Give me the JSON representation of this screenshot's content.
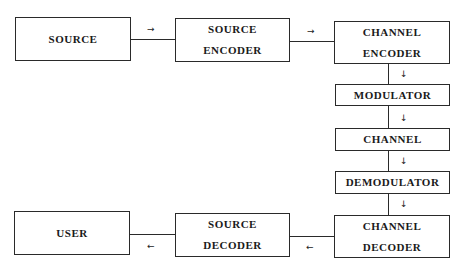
{
  "diagram": {
    "type": "block-diagram",
    "blocks": [
      {
        "id": "source",
        "lines": [
          "SOURCE"
        ]
      },
      {
        "id": "source_encoder",
        "lines": [
          "SOURCE",
          "ENCODER"
        ]
      },
      {
        "id": "channel_encoder",
        "lines": [
          "CHANNEL",
          "ENCODER"
        ]
      },
      {
        "id": "modulator",
        "lines": [
          "MODULATOR"
        ]
      },
      {
        "id": "channel",
        "lines": [
          "CHANNEL"
        ]
      },
      {
        "id": "demodulator",
        "lines": [
          "DEMODULATOR"
        ]
      },
      {
        "id": "channel_decoder",
        "lines": [
          "CHANNEL",
          "DECODER"
        ]
      },
      {
        "id": "source_decoder",
        "lines": [
          "SOURCE",
          "DECODER"
        ]
      },
      {
        "id": "user",
        "lines": [
          "USER"
        ]
      }
    ],
    "edges": [
      {
        "from": "source",
        "to": "source_encoder",
        "arrow": "→"
      },
      {
        "from": "source_encoder",
        "to": "channel_encoder",
        "arrow": "→"
      },
      {
        "from": "channel_encoder",
        "to": "modulator",
        "arrow": "↓"
      },
      {
        "from": "modulator",
        "to": "channel",
        "arrow": "↓"
      },
      {
        "from": "channel",
        "to": "demodulator",
        "arrow": "↓"
      },
      {
        "from": "demodulator",
        "to": "channel_decoder",
        "arrow": "↓"
      },
      {
        "from": "channel_decoder",
        "to": "source_decoder",
        "arrow": "←"
      },
      {
        "from": "source_decoder",
        "to": "user",
        "arrow": "←"
      }
    ]
  }
}
